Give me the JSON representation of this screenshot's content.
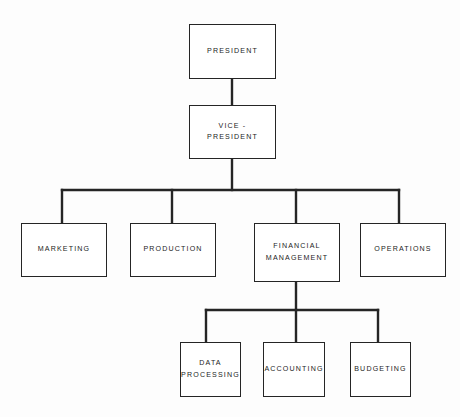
{
  "chart": {
    "type": "organization-chart",
    "orientation": "top-down",
    "background_color": "#fdfdfd",
    "line_color": "#252525",
    "box_fill": "#ffffff",
    "text_color": "#1d1d1d",
    "levels": 4,
    "nodes": [
      {
        "id": "president",
        "label": "PRESIDENT",
        "level": 1,
        "x": 189,
        "y": 24,
        "w": 87,
        "h": 55,
        "parent": null
      },
      {
        "id": "vice-president",
        "label": "VICE -\nPRESIDENT",
        "level": 2,
        "x": 189,
        "y": 105,
        "w": 87,
        "h": 54,
        "parent": "president"
      },
      {
        "id": "marketing",
        "label": "MARKETING",
        "level": 3,
        "x": 21,
        "y": 223,
        "w": 86,
        "h": 54,
        "parent": "vice-president"
      },
      {
        "id": "production",
        "label": "PRODUCTION",
        "level": 3,
        "x": 130,
        "y": 223,
        "w": 86,
        "h": 54,
        "parent": "vice-president"
      },
      {
        "id": "financial-management",
        "label": "FINANCIAL\nMANAGEMENT",
        "level": 3,
        "x": 254,
        "y": 223,
        "w": 86,
        "h": 59,
        "parent": "vice-president"
      },
      {
        "id": "operations",
        "label": "OPERATIONS",
        "level": 3,
        "x": 360,
        "y": 223,
        "w": 86,
        "h": 54,
        "parent": "vice-president"
      },
      {
        "id": "data-processing",
        "label": "DATA\nPROCESSING",
        "level": 4,
        "x": 180,
        "y": 342,
        "w": 61,
        "h": 55,
        "parent": "financial-management"
      },
      {
        "id": "accounting",
        "label": "ACCOUNTING",
        "level": 4,
        "x": 263,
        "y": 342,
        "w": 62,
        "h": 55,
        "parent": "financial-management"
      },
      {
        "id": "budgeting",
        "label": "BUDGETING",
        "level": 4,
        "x": 350,
        "y": 342,
        "w": 61,
        "h": 55,
        "parent": "financial-management"
      }
    ],
    "connectors": {
      "president_to_vp": {
        "x": 232,
        "y1": 79,
        "y2": 105
      },
      "vp_stem": {
        "x": 232,
        "y1": 159,
        "y2": 190
      },
      "level3_bus": {
        "y": 190,
        "x1": 62,
        "x2": 399
      },
      "level3_drops": [
        {
          "x": 62,
          "y1": 190,
          "y2": 223,
          "to": "marketing"
        },
        {
          "x": 172,
          "y1": 190,
          "y2": 223,
          "to": "production"
        },
        {
          "x": 296,
          "y1": 190,
          "y2": 223,
          "to": "financial-management"
        },
        {
          "x": 399,
          "y1": 190,
          "y2": 223,
          "to": "operations"
        }
      ],
      "fm_stem": {
        "x": 296,
        "y1": 282,
        "y2": 310
      },
      "level4_bus": {
        "y": 310,
        "x1": 206,
        "x2": 378
      },
      "level4_drops": [
        {
          "x": 206,
          "y1": 310,
          "y2": 342,
          "to": "data-processing"
        },
        {
          "x": 296,
          "y1": 310,
          "y2": 342,
          "to": "accounting"
        },
        {
          "x": 378,
          "y1": 310,
          "y2": 342,
          "to": "budgeting"
        }
      ]
    }
  }
}
